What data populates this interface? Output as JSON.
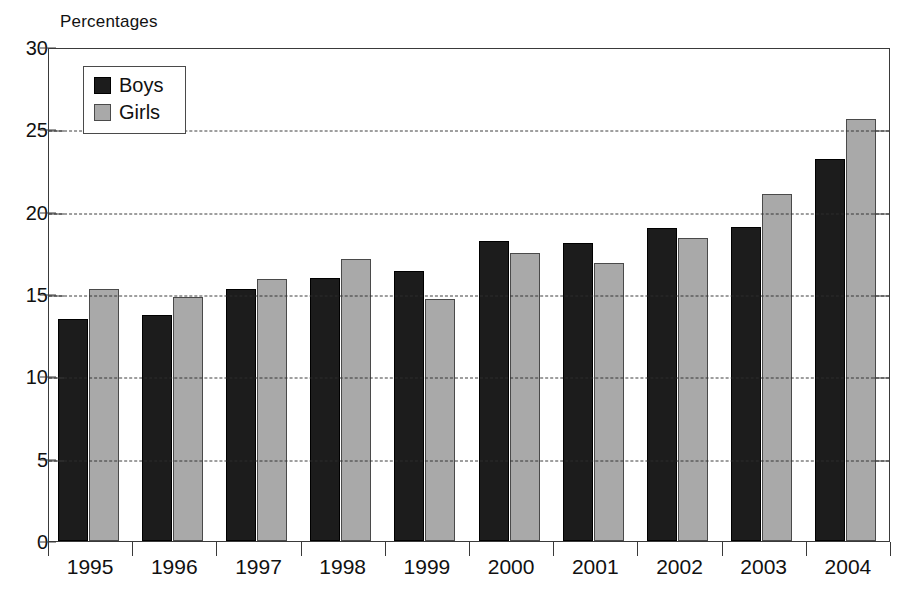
{
  "chart_data": {
    "type": "bar",
    "title": "",
    "ylabel": "Percentages",
    "xlabel": "",
    "categories": [
      "1995",
      "1996",
      "1997",
      "1998",
      "1999",
      "2000",
      "2001",
      "2002",
      "2003",
      "2004"
    ],
    "series": [
      {
        "name": "Boys",
        "color": "#1c1c1c",
        "values": [
          13.5,
          13.7,
          15.3,
          16.0,
          16.4,
          18.2,
          18.1,
          19.0,
          19.1,
          23.2
        ]
      },
      {
        "name": "Girls",
        "color": "#a9a9a9",
        "values": [
          15.3,
          14.8,
          15.9,
          17.1,
          14.7,
          17.5,
          16.9,
          18.4,
          21.1,
          25.6
        ]
      }
    ],
    "ylim": [
      0,
      30
    ],
    "yticks": [
      0,
      5,
      10,
      15,
      20,
      25,
      30
    ],
    "ytick_labels": [
      "0",
      "5",
      "10",
      "15",
      "20",
      "25",
      "30"
    ],
    "grid": "horizontal-dashed",
    "legend_position": "top-left",
    "legend_entries": [
      "Boys",
      "Girls"
    ]
  },
  "axis": {
    "y_title": "Percentages"
  },
  "legend": {
    "items": [
      {
        "label": "Boys",
        "swatch": "black-square-swatch"
      },
      {
        "label": "Girls",
        "swatch": "gray-square-swatch"
      }
    ]
  }
}
